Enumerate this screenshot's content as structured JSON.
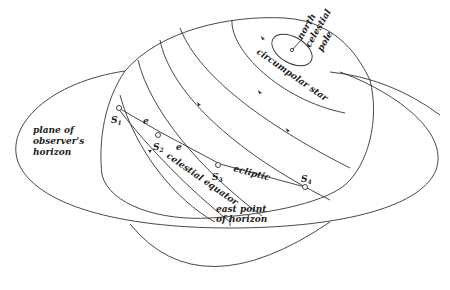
{
  "diagram": {
    "labels": {
      "north_celestial_pole": [
        "north",
        "celestial",
        "pole"
      ],
      "circumpolar_star": "circumpolar star",
      "horizon_plane": [
        "plane of",
        "observer's",
        "horizon"
      ],
      "ecliptic": "ecliptic",
      "celestial_equator": "celestial equator",
      "east_point": [
        "east point",
        "of horizon"
      ],
      "angle_e1": "e",
      "angle_e2": "e"
    },
    "stars": [
      {
        "id": "S1",
        "label": "S",
        "sub": "1"
      },
      {
        "id": "S2",
        "label": "S",
        "sub": "2"
      },
      {
        "id": "S3",
        "label": "S",
        "sub": "3"
      },
      {
        "id": "S4",
        "label": "S",
        "sub": "4"
      }
    ],
    "colors": {
      "line": "#333333",
      "text": "#222222",
      "background": "#ffffff"
    }
  }
}
